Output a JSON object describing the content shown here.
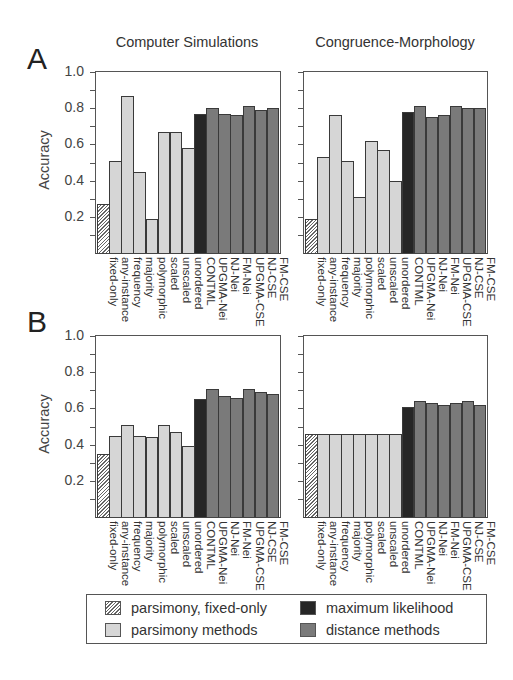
{
  "figure": {
    "panel_letters": [
      "A",
      "B"
    ],
    "column_titles": [
      "Computer Simulations",
      "Congruence-Morphology"
    ],
    "ylabel": "Accuracy",
    "yticks": [
      "1.0",
      "0.8",
      "0.6",
      "0.4",
      "0.2"
    ]
  },
  "legend": {
    "items": [
      {
        "label": "parsimony, fixed-only",
        "style": "hatch"
      },
      {
        "label": "maximum likelihood",
        "style": "ml"
      },
      {
        "label": "parsimony methods",
        "style": "pars"
      },
      {
        "label": "distance methods",
        "style": "dist"
      }
    ]
  },
  "colors": {
    "parsimony_fixed_only": "hatched",
    "parsimony_methods": "#d6d6d6",
    "maximum_likelihood": "#262626",
    "distance_methods": "#7a7a7a"
  },
  "chart_data": [
    {
      "type": "bar",
      "panel": "A",
      "title": "Computer Simulations",
      "xlabel": "",
      "ylabel": "Accuracy",
      "ylim": [
        0,
        1.0
      ],
      "categories": [
        "fixed-only",
        "any-instance",
        "frequency",
        "majority",
        "polymorphic",
        "scaled",
        "unscaled",
        "unordered",
        "CONTML",
        "UPGMA-Nei",
        "NJ-Nei",
        "FM-Nei",
        "UPGMA-CSE",
        "NJ-CSE",
        "FM-CSE"
      ],
      "groups": [
        "hatch",
        "pars",
        "pars",
        "pars",
        "pars",
        "pars",
        "pars",
        "pars",
        "ml",
        "dist",
        "dist",
        "dist",
        "dist",
        "dist",
        "dist"
      ],
      "values": [
        0.27,
        0.51,
        0.87,
        0.45,
        0.19,
        0.67,
        0.67,
        0.58,
        0.77,
        0.8,
        0.77,
        0.76,
        0.81,
        0.79,
        0.8
      ]
    },
    {
      "type": "bar",
      "panel": "A",
      "title": "Congruence-Morphology",
      "xlabel": "",
      "ylabel": "Accuracy",
      "ylim": [
        0,
        1.0
      ],
      "categories": [
        "fixed-only",
        "any-instance",
        "frequency",
        "majority",
        "polymorphic",
        "scaled",
        "unscaled",
        "unordered",
        "CONTML",
        "UPGMA-Nei",
        "NJ-Nei",
        "FM-Nei",
        "UPGMA-CSE",
        "NJ-CSE",
        "FM-CSE"
      ],
      "groups": [
        "hatch",
        "pars",
        "pars",
        "pars",
        "pars",
        "pars",
        "pars",
        "pars",
        "ml",
        "dist",
        "dist",
        "dist",
        "dist",
        "dist",
        "dist"
      ],
      "values": [
        0.19,
        0.53,
        0.76,
        0.51,
        0.31,
        0.62,
        0.57,
        0.4,
        0.78,
        0.81,
        0.75,
        0.76,
        0.81,
        0.8,
        0.8
      ]
    },
    {
      "type": "bar",
      "panel": "B",
      "title": "Computer Simulations",
      "xlabel": "",
      "ylabel": "Accuracy",
      "ylim": [
        0,
        1.0
      ],
      "categories": [
        "fixed-only",
        "any-instance",
        "frequency",
        "majority",
        "polymorphic",
        "scaled",
        "unscaled",
        "unordered",
        "CONTML",
        "UPGMA-Nei",
        "NJ-Nei",
        "FM-Nei",
        "UPGMA-CSE",
        "NJ-CSE",
        "FM-CSE"
      ],
      "groups": [
        "hatch",
        "pars",
        "pars",
        "pars",
        "pars",
        "pars",
        "pars",
        "pars",
        "ml",
        "dist",
        "dist",
        "dist",
        "dist",
        "dist",
        "dist"
      ],
      "values": [
        0.35,
        0.45,
        0.51,
        0.45,
        0.44,
        0.51,
        0.47,
        0.39,
        0.65,
        0.71,
        0.67,
        0.66,
        0.71,
        0.69,
        0.68
      ]
    },
    {
      "type": "bar",
      "panel": "B",
      "title": "Congruence-Morphology",
      "xlabel": "",
      "ylabel": "Accuracy",
      "ylim": [
        0,
        1.0
      ],
      "categories": [
        "fixed-only",
        "any-instance",
        "frequency",
        "majority",
        "polymorphic",
        "scaled",
        "unscaled",
        "unordered",
        "CONTML",
        "UPGMA-Nei",
        "NJ-Nei",
        "FM-Nei",
        "UPGMA-CSE",
        "NJ-CSE",
        "FM-CSE"
      ],
      "groups": [
        "hatch",
        "pars",
        "pars",
        "pars",
        "pars",
        "pars",
        "pars",
        "pars",
        "ml",
        "dist",
        "dist",
        "dist",
        "dist",
        "dist",
        "dist"
      ],
      "values": [
        0.46,
        0.46,
        0.46,
        0.46,
        0.46,
        0.46,
        0.46,
        0.46,
        0.61,
        0.64,
        0.63,
        0.62,
        0.63,
        0.64,
        0.62
      ]
    }
  ]
}
